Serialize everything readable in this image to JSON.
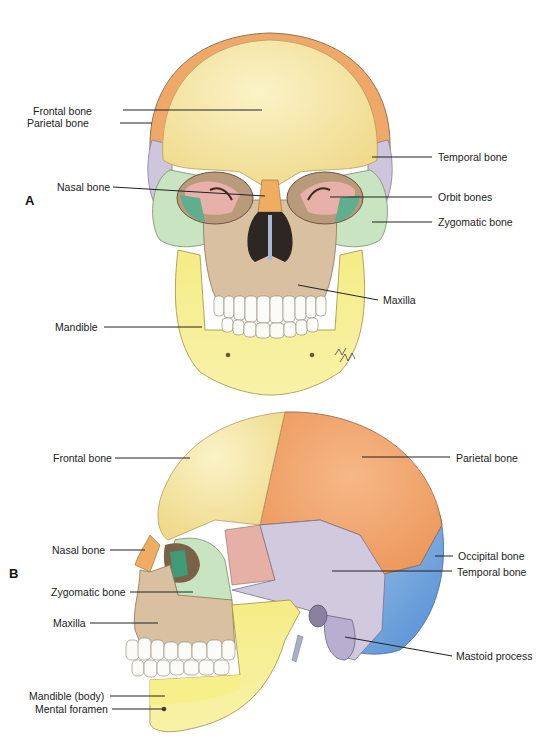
{
  "figure": {
    "panels": [
      {
        "id": "A",
        "label": "A",
        "view": "anterior",
        "annotations": [
          {
            "text": "Frontal bone",
            "side": "left",
            "label_xy": [
              33,
              111
            ],
            "line": [
              123,
              110,
              262,
              110
            ]
          },
          {
            "text": "Parietal bone",
            "side": "left",
            "label_xy": [
              27,
              123
            ],
            "line": [
              120,
              123,
              152,
              123
            ]
          },
          {
            "text": "Nasal bone",
            "side": "left",
            "label_xy": [
              57,
              187
            ],
            "line": [
              113,
              187,
              265,
              196
            ]
          },
          {
            "text": "Mandible",
            "side": "left",
            "label_xy": [
              55,
              327
            ],
            "line": [
              104,
              327,
              202,
              327
            ]
          },
          {
            "text": "Temporal bone",
            "side": "right",
            "label_xy": [
              438,
              157
            ],
            "line": [
              372,
              157,
              432,
              157
            ]
          },
          {
            "text": "Orbit bones",
            "side": "right",
            "label_xy": [
              438,
              197
            ],
            "line": [
              330,
              197,
              432,
              197
            ]
          },
          {
            "text": "Zygomatic bone",
            "side": "right",
            "label_xy": [
              438,
              222
            ],
            "line": [
              372,
              222,
              432,
              222
            ]
          },
          {
            "text": "Maxilla",
            "side": "right",
            "label_xy": [
              383,
              300
            ],
            "line": [
              298,
              285,
              378,
              300
            ]
          }
        ]
      },
      {
        "id": "B",
        "label": "B",
        "view": "lateral",
        "annotations": [
          {
            "text": "Frontal bone",
            "side": "left",
            "label_xy": [
              53,
              458
            ],
            "line": [
              115,
              458,
              190,
              458
            ]
          },
          {
            "text": "Nasal bone",
            "side": "left",
            "label_xy": [
              52,
              550
            ],
            "line": [
              110,
              550,
              145,
              550
            ]
          },
          {
            "text": "Zygomatic bone",
            "side": "left",
            "label_xy": [
              51,
              592
            ],
            "line": [
              130,
              592,
              193,
              592
            ]
          },
          {
            "text": "Maxilla",
            "side": "left",
            "label_xy": [
              53,
              623
            ],
            "line": [
              90,
              623,
              158,
              623
            ]
          },
          {
            "text": "Mandible (body)",
            "side": "left",
            "label_xy": [
              29,
              696
            ],
            "line": [
              110,
              696,
              165,
              696
            ]
          },
          {
            "text": "Mental foramen",
            "side": "left",
            "label_xy": [
              35,
              709
            ],
            "line": [
              112,
              709,
              163,
              709
            ]
          },
          {
            "text": "Parietal bone",
            "side": "right",
            "label_xy": [
              456,
              458
            ],
            "line": [
              362,
              457,
              450,
              457
            ]
          },
          {
            "text": "Occipital bone",
            "side": "right",
            "label_xy": [
              458,
              556
            ],
            "line": [
              435,
              556,
              453,
              556
            ]
          },
          {
            "text": "Temporal bone",
            "side": "right",
            "label_xy": [
              457,
              572
            ],
            "line": [
              332,
              571,
              452,
              571
            ]
          },
          {
            "text": "Mastoid process",
            "side": "right",
            "label_xy": [
              456,
              656
            ],
            "line": [
              345,
              637,
              452,
              656
            ]
          }
        ]
      }
    ],
    "signature": "artist signature",
    "colors": {
      "frontal": "#f6e49a",
      "parietal": "#f2a66a",
      "temporal": "#cfc9dc",
      "occipital": "#6fa3dc",
      "zygomatic": "#c9e5c0",
      "maxilla": "#d8bf9d",
      "mandible": "#f7ef8a",
      "nasal": "#f0b468",
      "sphenoid": "#e8b4ac",
      "orbit_green": "#5aa88a",
      "teeth": "#fbfbf8",
      "outline": "#7a6a50",
      "leader": "#222222"
    }
  }
}
